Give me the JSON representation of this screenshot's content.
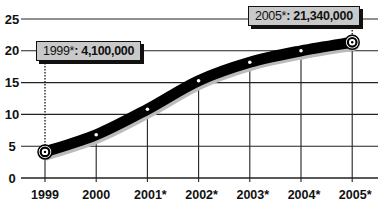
{
  "chart_data": {
    "type": "line",
    "title": "",
    "xlabel": "",
    "ylabel": "",
    "categories": [
      "1999",
      "2000",
      "2001*",
      "2002*",
      "2003*",
      "2004*",
      "2005*"
    ],
    "series": [
      {
        "name": "Value (millions)",
        "values": [
          4.1,
          6.8,
          10.8,
          15.3,
          18.2,
          20.0,
          21.34
        ]
      }
    ],
    "yticks": [
      0,
      5,
      10,
      15,
      20,
      25
    ],
    "ylim": [
      0,
      25
    ],
    "grid": true,
    "legend": "none",
    "annotations": [
      {
        "category": "1999",
        "year_label": "1999*",
        "value_label": "4,100,000"
      },
      {
        "category": "2005*",
        "year_label": "2005*",
        "value_label": "21,340,000"
      }
    ]
  },
  "callouts": {
    "first": {
      "year": "1999*",
      "sep": ": ",
      "value": "4,100,000"
    },
    "last": {
      "year": "2005*",
      "sep": ": ",
      "value": "21,340,000"
    }
  },
  "colors": {
    "line": "#000000",
    "grid": "#222222",
    "callout_fill": "#c9c9c9"
  }
}
